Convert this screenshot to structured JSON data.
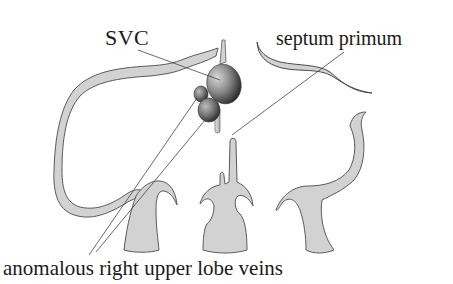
{
  "diagram": {
    "labels": {
      "svc": "SVC",
      "septum_primum": "septum primum",
      "anomalous_veins": "anomalous right upper lobe veins"
    },
    "structures": [
      {
        "id": "atrial-wall-left-loop",
        "description": "right atrial wall outline"
      },
      {
        "id": "svc",
        "description": "superior vena cava (shaded ellipse)"
      },
      {
        "id": "anomalous-vein-upper",
        "description": "anomalous right upper lobe vein (small shaded ellipse)"
      },
      {
        "id": "anomalous-vein-lower",
        "description": "anomalous right upper lobe vein (shaded ellipse)"
      },
      {
        "id": "septum-primum",
        "description": "septum primum curved membrane"
      },
      {
        "id": "septal-stalk",
        "description": "central septal column"
      },
      {
        "id": "left-pedestal",
        "description": "left hooked pedestal"
      },
      {
        "id": "middle-trident",
        "description": "middle trident pedestal"
      },
      {
        "id": "right-curl",
        "description": "right curled pedestal"
      }
    ],
    "colors": {
      "fill": "#d2d2d2",
      "stroke": "#555555",
      "leader": "#444444",
      "text": "#1a1a1a",
      "shade_light": "#c8c8c8",
      "shade_dark": "#2a2a2a"
    }
  }
}
